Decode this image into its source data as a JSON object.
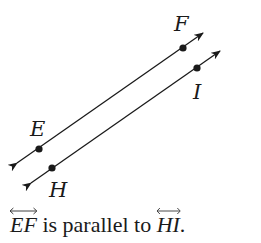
{
  "diagram": {
    "lines": [
      {
        "name": "EF",
        "points": [
          "E",
          "F"
        ]
      },
      {
        "name": "HI",
        "points": [
          "H",
          "I"
        ]
      }
    ],
    "labels": {
      "E": "E",
      "F": "F",
      "H": "H",
      "I": "I"
    },
    "color": "#1a1a1a"
  },
  "caption": {
    "line1": "EF",
    "middle": " is parallel to ",
    "line2": "HI",
    "end": "."
  }
}
